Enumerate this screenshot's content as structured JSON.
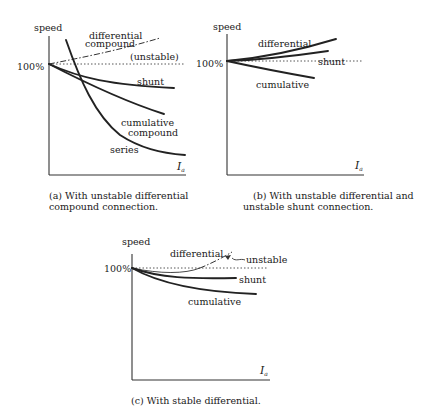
{
  "figure": {
    "panels": [
      {
        "id": "a",
        "y_label": "speed",
        "x_label": "I",
        "x_label_sub": "a",
        "ref_label": "100%",
        "curve_labels": {
          "differential_1": "differential",
          "differential_2": "compound",
          "unstable": "(unstable)",
          "shunt": "shunt",
          "cumulative_1": "cumulative",
          "cumulative_2": "compound",
          "series": "series"
        },
        "caption_1": "(a) With unstable differential",
        "caption_2": "compound connection."
      },
      {
        "id": "b",
        "y_label": "speed",
        "x_label": "I",
        "x_label_sub": "a",
        "ref_label": "100%",
        "curve_labels": {
          "differential": "differential",
          "shunt": "shunt",
          "cumulative": "cumulative"
        },
        "caption_1": "(b) With unstable differential and",
        "caption_2": "unstable shunt connection."
      },
      {
        "id": "c",
        "y_label": "speed",
        "x_label": "I",
        "x_label_sub": "a",
        "ref_label": "100%",
        "curve_labels": {
          "differential": "differential",
          "unstable": "unstable",
          "shunt": "shunt",
          "cumulative": "cumulative"
        },
        "caption_1": "(c) With stable differential."
      }
    ]
  }
}
